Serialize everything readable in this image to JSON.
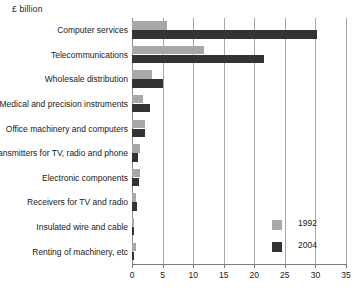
{
  "chart_data": {
    "type": "bar",
    "orientation": "horizontal",
    "title": "",
    "unit_caption": "£ billion",
    "xlabel": "",
    "ylabel": "",
    "xlim": [
      0,
      35
    ],
    "xticks": [
      0,
      5,
      10,
      15,
      20,
      25,
      30,
      35
    ],
    "xtick_labels": [
      "0",
      "5",
      "10",
      "15",
      "20",
      "25",
      "30",
      "35"
    ],
    "grid": true,
    "grid_axis": "x",
    "legend_position": "inside-bottom-right",
    "categories": [
      "Computer services",
      "Telecommunications",
      "Wholesale distribution",
      "Medical and precision instruments",
      "Office machinery and computers",
      "Transmitters for TV, radio and phone",
      "Electronic components",
      "Receivers for TV and radio",
      "Insulated wire and cable",
      "Renting of machinery, etc"
    ],
    "series": [
      {
        "name": "1992",
        "color": "#a8a8a8",
        "values": [
          5.8,
          11.8,
          3.3,
          1.8,
          2.2,
          1.3,
          1.3,
          0.7,
          0.35,
          0.6
        ]
      },
      {
        "name": "2004",
        "color": "#333333",
        "values": [
          30.3,
          21.6,
          5.1,
          3.0,
          2.1,
          0.9,
          1.2,
          0.8,
          0.35,
          0.35
        ]
      }
    ]
  },
  "legend": {
    "items": [
      {
        "label": "1992",
        "color": "#a8a8a8"
      },
      {
        "label": "2004",
        "color": "#333333"
      }
    ]
  }
}
